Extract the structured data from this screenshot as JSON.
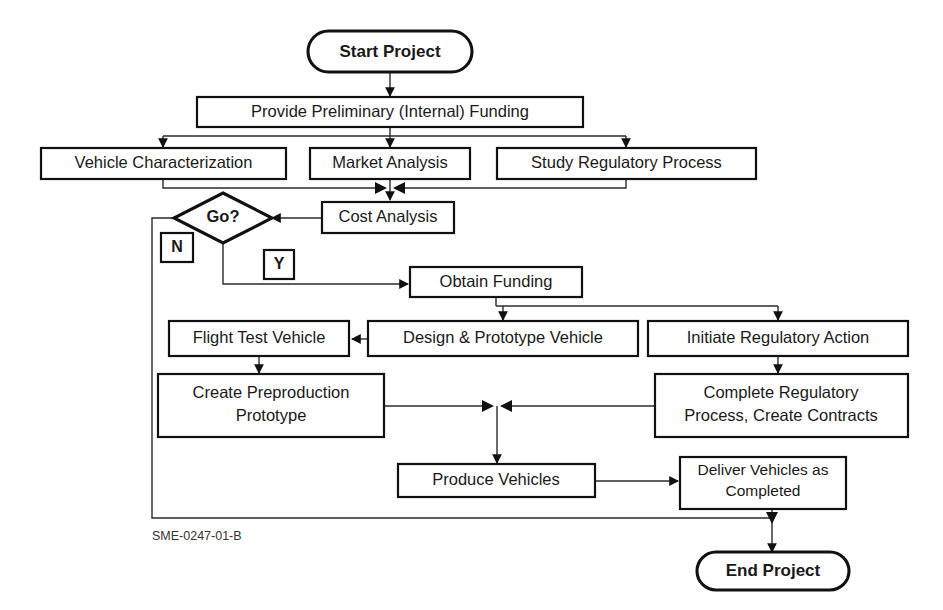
{
  "diagram": {
    "caption": "SME-0247-01-B",
    "background_color": "#ffffff",
    "line_color": "#2b2b2b",
    "text_color": "#1a1a1a",
    "terminators": [
      {
        "id": "start",
        "label": "Start Project"
      },
      {
        "id": "end",
        "label": "End Project"
      }
    ],
    "decisions": [
      {
        "id": "go",
        "label": "Go?"
      }
    ],
    "branch_labels": [
      {
        "id": "no",
        "label": "N"
      },
      {
        "id": "yes",
        "label": "Y"
      }
    ],
    "processes": [
      {
        "id": "prelim-funding",
        "label": "Provide Preliminary (Internal) Funding"
      },
      {
        "id": "vehicle-characterization",
        "label": "Vehicle Characterization"
      },
      {
        "id": "market-analysis",
        "label": "Market Analysis"
      },
      {
        "id": "study-regulatory-process",
        "label": "Study Regulatory Process"
      },
      {
        "id": "cost-analysis",
        "label": "Cost Analysis"
      },
      {
        "id": "obtain-funding",
        "label": "Obtain Funding"
      },
      {
        "id": "flight-test-vehicle",
        "label": "Flight Test Vehicle"
      },
      {
        "id": "design-prototype-vehicle",
        "label": "Design & Prototype Vehicle"
      },
      {
        "id": "initiate-regulatory-action",
        "label": "Initiate Regulatory Action"
      },
      {
        "id": "create-preproduction-prototype",
        "line1": "Create Preproduction",
        "line2": "Prototype"
      },
      {
        "id": "complete-regulatory-process",
        "line1": "Complete Regulatory",
        "line2": "Process, Create Contracts"
      },
      {
        "id": "produce-vehicles",
        "label": "Produce Vehicles"
      },
      {
        "id": "deliver-vehicles",
        "line1": "Deliver Vehicles as",
        "line2": "Completed"
      }
    ]
  }
}
